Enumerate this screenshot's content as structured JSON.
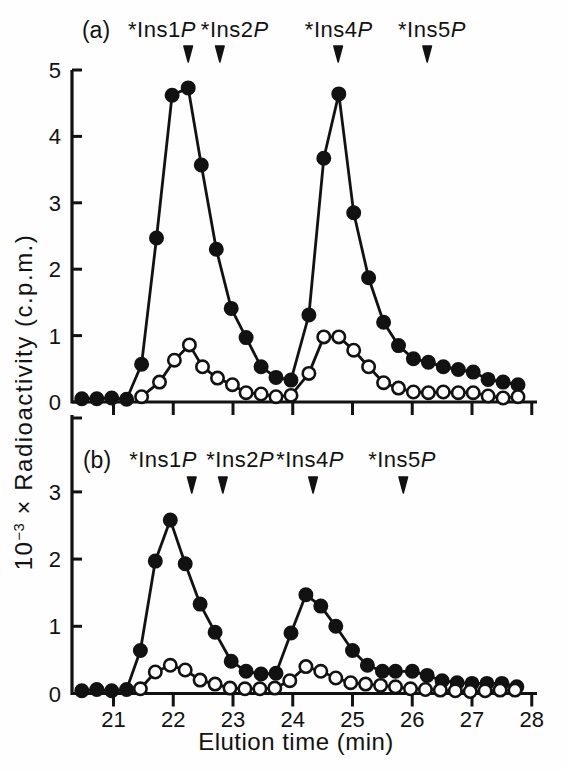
{
  "figure": {
    "background": "#fefefe",
    "ink_color": "#121212",
    "x_axis_label": "Elution time (min)",
    "y_axis_label": {
      "base": "10",
      "exponent": "−3",
      "rest": " × Radioactivity (c.p.m.)"
    },
    "xticks": [
      21,
      22,
      23,
      24,
      25,
      26,
      27,
      28
    ]
  },
  "chart_data": [
    {
      "type": "line",
      "panel_label": "(a)",
      "xlim": [
        20.3,
        28.1
      ],
      "ylim": [
        0,
        5
      ],
      "yticks": [
        0,
        1,
        2,
        3,
        4,
        5
      ],
      "grid": false,
      "legend": false,
      "show_xtick_labels": false,
      "annotations": [
        {
          "prefix": "*Ins1",
          "italic": "P",
          "label_x": 21.81,
          "arrow_x": 22.25
        },
        {
          "prefix": "*Ins2",
          "italic": "P",
          "label_x": 23.03,
          "arrow_x": 22.78
        },
        {
          "prefix": "*Ins4",
          "italic": "P",
          "label_x": 24.77,
          "arrow_x": 24.76
        },
        {
          "prefix": "*Ins5",
          "italic": "P",
          "label_x": 26.33,
          "arrow_x": 26.25
        }
      ],
      "series": [
        {
          "name": "filled-circles",
          "marker": "filled-circle",
          "points": [
            [
              20.47,
              0.05
            ],
            [
              20.72,
              0.05
            ],
            [
              20.97,
              0.06
            ],
            [
              21.22,
              0.04
            ],
            [
              21.47,
              0.57
            ],
            [
              21.72,
              2.47
            ],
            [
              21.98,
              4.62
            ],
            [
              22.25,
              4.73
            ],
            [
              22.47,
              3.57
            ],
            [
              22.72,
              2.3
            ],
            [
              22.97,
              1.41
            ],
            [
              23.22,
              0.97
            ],
            [
              23.47,
              0.53
            ],
            [
              23.72,
              0.37
            ],
            [
              23.97,
              0.33
            ],
            [
              24.27,
              1.31
            ],
            [
              24.52,
              3.67
            ],
            [
              24.77,
              4.64
            ],
            [
              25.02,
              2.85
            ],
            [
              25.27,
              1.87
            ],
            [
              25.52,
              1.2
            ],
            [
              25.77,
              0.85
            ],
            [
              26.02,
              0.65
            ],
            [
              26.27,
              0.6
            ],
            [
              26.52,
              0.53
            ],
            [
              26.77,
              0.49
            ],
            [
              27.02,
              0.45
            ],
            [
              27.27,
              0.34
            ],
            [
              27.52,
              0.3
            ],
            [
              27.77,
              0.26
            ]
          ]
        },
        {
          "name": "open-circles",
          "marker": "open-circle",
          "points": [
            [
              21.47,
              0.08
            ],
            [
              21.77,
              0.3
            ],
            [
              22.02,
              0.63
            ],
            [
              22.27,
              0.86
            ],
            [
              22.49,
              0.53
            ],
            [
              22.74,
              0.36
            ],
            [
              22.99,
              0.26
            ],
            [
              23.22,
              0.14
            ],
            [
              23.47,
              0.12
            ],
            [
              23.72,
              0.08
            ],
            [
              23.97,
              0.1
            ],
            [
              24.27,
              0.43
            ],
            [
              24.52,
              0.98
            ],
            [
              24.77,
              0.98
            ],
            [
              25.02,
              0.78
            ],
            [
              25.27,
              0.53
            ],
            [
              25.52,
              0.29
            ],
            [
              25.77,
              0.21
            ],
            [
              26.02,
              0.15
            ],
            [
              26.27,
              0.14
            ],
            [
              26.52,
              0.15
            ],
            [
              26.77,
              0.14
            ],
            [
              27.02,
              0.14
            ],
            [
              27.27,
              0.09
            ],
            [
              27.52,
              0.06
            ],
            [
              27.77,
              0.08
            ]
          ]
        }
      ]
    },
    {
      "type": "line",
      "panel_label": "(b)",
      "xlim": [
        20.3,
        28.1
      ],
      "ylim": [
        0,
        3
      ],
      "yticks": [
        0,
        1,
        2,
        3
      ],
      "grid": false,
      "legend": false,
      "show_xtick_labels": true,
      "annotations": [
        {
          "prefix": "*Ins1",
          "italic": "P",
          "label_x": 21.83,
          "arrow_x": 22.31
        },
        {
          "prefix": "*Ins2",
          "italic": "P",
          "label_x": 23.12,
          "arrow_x": 22.83
        },
        {
          "prefix": "*Ins4",
          "italic": "P",
          "label_x": 24.29,
          "arrow_x": 24.34
        },
        {
          "prefix": "*Ins5",
          "italic": "P",
          "label_x": 25.83,
          "arrow_x": 25.85
        }
      ],
      "series": [
        {
          "name": "filled-circles",
          "marker": "filled-circle",
          "points": [
            [
              20.47,
              0.04
            ],
            [
              20.72,
              0.06
            ],
            [
              20.97,
              0.04
            ],
            [
              21.22,
              0.06
            ],
            [
              21.45,
              0.64
            ],
            [
              21.7,
              1.97
            ],
            [
              21.95,
              2.58
            ],
            [
              22.2,
              1.93
            ],
            [
              22.45,
              1.33
            ],
            [
              22.7,
              0.91
            ],
            [
              22.97,
              0.48
            ],
            [
              23.22,
              0.33
            ],
            [
              23.47,
              0.29
            ],
            [
              23.72,
              0.3
            ],
            [
              23.97,
              0.9
            ],
            [
              24.22,
              1.47
            ],
            [
              24.47,
              1.3
            ],
            [
              24.72,
              1.0
            ],
            [
              25.0,
              0.64
            ],
            [
              25.25,
              0.42
            ],
            [
              25.5,
              0.33
            ],
            [
              25.72,
              0.33
            ],
            [
              26.0,
              0.33
            ],
            [
              26.25,
              0.27
            ],
            [
              26.5,
              0.19
            ],
            [
              26.75,
              0.16
            ],
            [
              27.0,
              0.15
            ],
            [
              27.25,
              0.15
            ],
            [
              27.5,
              0.15
            ],
            [
              27.75,
              0.1
            ]
          ]
        },
        {
          "name": "open-circles",
          "marker": "open-circle",
          "points": [
            [
              21.45,
              0.07
            ],
            [
              21.7,
              0.32
            ],
            [
              21.95,
              0.42
            ],
            [
              22.2,
              0.35
            ],
            [
              22.45,
              0.2
            ],
            [
              22.7,
              0.14
            ],
            [
              22.95,
              0.08
            ],
            [
              23.2,
              0.07
            ],
            [
              23.45,
              0.07
            ],
            [
              23.7,
              0.08
            ],
            [
              23.95,
              0.19
            ],
            [
              24.22,
              0.4
            ],
            [
              24.47,
              0.33
            ],
            [
              24.72,
              0.23
            ],
            [
              24.97,
              0.16
            ],
            [
              25.22,
              0.14
            ],
            [
              25.47,
              0.12
            ],
            [
              25.72,
              0.1
            ],
            [
              25.97,
              0.07
            ],
            [
              26.22,
              0.06
            ],
            [
              26.47,
              0.05
            ],
            [
              26.72,
              0.04
            ],
            [
              26.97,
              0.03
            ],
            [
              27.22,
              0.04
            ],
            [
              27.47,
              0.05
            ],
            [
              27.72,
              0.05
            ]
          ]
        }
      ]
    }
  ]
}
